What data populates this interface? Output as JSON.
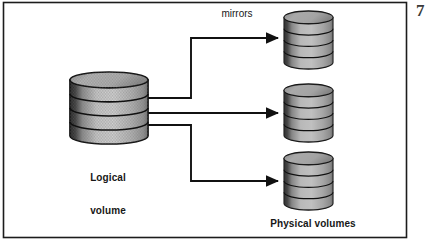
{
  "figure": {
    "page_mark": "7",
    "frame": {
      "x": 3,
      "y": 2,
      "width": 404,
      "height": 236,
      "border_color": "#1c1c1c",
      "background_color": "#ffffff"
    },
    "labels": {
      "mirrors": "mirrors",
      "logical_volume_line1": "Logical",
      "logical_volume_line2": "volume",
      "physical_volumes": "Physical volumes"
    },
    "colors": {
      "ink": "#171717",
      "cylinder_outline": "#101010",
      "cylinder_dark": "#2b2b2b",
      "cylinder_mid": "#a8a8a8",
      "cylinder_light": "#d2d2d2",
      "cylinder_top": "#b4b4b4",
      "arrow": "#111111"
    },
    "source_volume": {
      "name": "Logical volume",
      "shape": "stacked-disk-cylinder",
      "segments": 4,
      "x": 70,
      "y": 72,
      "width": 78,
      "height": 72
    },
    "target_volumes": [
      {
        "name": "Physical volume 1",
        "shape": "stacked-disk-cylinder",
        "segments": 4,
        "x": 284,
        "y": 11,
        "width": 49,
        "height": 58
      },
      {
        "name": "Physical volume 2",
        "shape": "stacked-disk-cylinder",
        "segments": 4,
        "x": 284,
        "y": 84,
        "width": 49,
        "height": 58
      },
      {
        "name": "Physical volume 3",
        "shape": "stacked-disk-cylinder",
        "segments": 4,
        "x": 284,
        "y": 152,
        "width": 49,
        "height": 58
      }
    ],
    "connectors": [
      {
        "name": "mirror-arrow-top",
        "from": "Logical volume",
        "to": "Physical volume 1",
        "style": "elbow-up",
        "start": [
          148,
          98
        ],
        "elbow_x": 191,
        "end": [
          283,
          38
        ]
      },
      {
        "name": "mirror-arrow-middle",
        "from": "Logical volume",
        "to": "Physical volume 2",
        "style": "straight",
        "start": [
          148,
          113
        ],
        "end": [
          283,
          113
        ]
      },
      {
        "name": "mirror-arrow-bottom",
        "from": "Logical volume",
        "to": "Physical volume 3",
        "style": "elbow-down",
        "start": [
          148,
          125
        ],
        "elbow_x": 191,
        "end": [
          283,
          181
        ]
      }
    ]
  }
}
